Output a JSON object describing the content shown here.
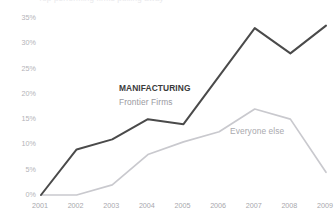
{
  "clipped_title": "Top performing firms pulling away",
  "chart_data": {
    "type": "line",
    "title": "",
    "xlabel": "",
    "ylabel": "",
    "categories": [
      "2001",
      "2002",
      "2003",
      "2004",
      "2005",
      "2006",
      "2007",
      "2008",
      "2009"
    ],
    "x": [
      2001,
      2002,
      2003,
      2004,
      2005,
      2006,
      2007,
      2008,
      2009
    ],
    "ylim": [
      0,
      35
    ],
    "ytick_labels": [
      "0%",
      "5%",
      "10%",
      "15%",
      "20%",
      "25%",
      "30%",
      "35%"
    ],
    "ytick_values": [
      0,
      5,
      10,
      15,
      20,
      25,
      30,
      35
    ],
    "grid": false,
    "legend_position": "inline-annotation",
    "series": [
      {
        "name": "Frontier Firms",
        "group_label": "MANIFACTURING",
        "color": "#4a4a4a",
        "values": [
          0,
          9,
          11,
          15,
          14,
          23.5,
          33,
          28,
          33.5
        ]
      },
      {
        "name": "Everyone else",
        "color": "#c9c9ce",
        "values": [
          0,
          0,
          2,
          8,
          10.5,
          12.5,
          17,
          15,
          4.5
        ]
      }
    ],
    "annotations": [
      {
        "text": "MANIFACTURING",
        "series": "Frontier Firms",
        "style": "bold-dark"
      },
      {
        "text": "Frontier Firms",
        "series": "Frontier Firms",
        "style": "regular-gray"
      },
      {
        "text": "Everyone else",
        "series": "Everyone else",
        "style": "regular-gray"
      }
    ]
  },
  "colors": {
    "frontier_line": "#4a4a4a",
    "everyone_line": "#c9c9ce",
    "axis_text": "#aaaaaf",
    "background": "#ffffff"
  }
}
